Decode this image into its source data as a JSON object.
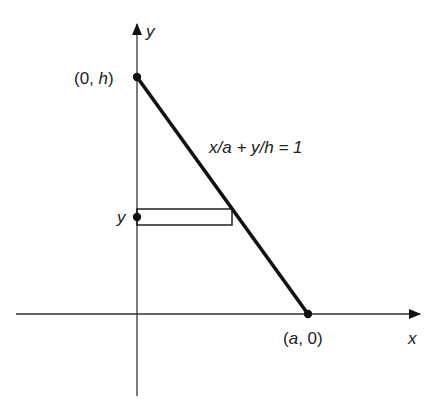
{
  "diagram": {
    "axes": {
      "x_label": "x",
      "y_label": "y"
    },
    "points": {
      "y_intercept": "(0, h)",
      "x_intercept": "(a, 0)",
      "y_point": "y"
    },
    "line_equation": "x/a + y/h = 1",
    "colors": {
      "ink": "#111111",
      "text": "#222222",
      "background": "#ffffff"
    }
  }
}
